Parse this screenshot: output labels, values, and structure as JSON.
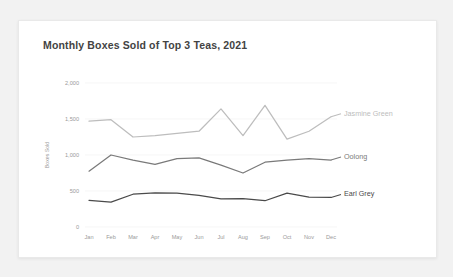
{
  "card": {
    "title": "Monthly Boxes Sold of Top 3 Teas, 2021"
  },
  "chart_data": {
    "type": "line",
    "title": "Monthly Boxes Sold of Top 3 Teas, 2021",
    "xlabel": "",
    "ylabel": "Boxes Sold",
    "categories": [
      "Jan",
      "Feb",
      "Mar",
      "Apr",
      "May",
      "Jun",
      "Jul",
      "Aug",
      "Sep",
      "Oct",
      "Nov",
      "Dec"
    ],
    "ylim": [
      0,
      2000
    ],
    "yticks": [
      0,
      500,
      1000,
      1500,
      2000
    ],
    "ytick_labels": [
      "0",
      "500",
      "1,000",
      "1,500",
      "2,000"
    ],
    "grid": false,
    "legend": "inline-right",
    "series": [
      {
        "name": "Jasmine Green",
        "color": "#bdbdbd",
        "values": [
          1470,
          1490,
          1250,
          1270,
          1300,
          1330,
          1640,
          1270,
          1690,
          1220,
          1330,
          1530
        ]
      },
      {
        "name": "Oolong",
        "color": "#7a7a7a",
        "values": [
          775,
          1000,
          930,
          870,
          950,
          960,
          860,
          750,
          900,
          930,
          950,
          930
        ]
      },
      {
        "name": "Earl Grey",
        "color": "#4a4a4a",
        "values": [
          370,
          345,
          455,
          475,
          470,
          440,
          390,
          395,
          365,
          470,
          415,
          410
        ]
      }
    ]
  }
}
